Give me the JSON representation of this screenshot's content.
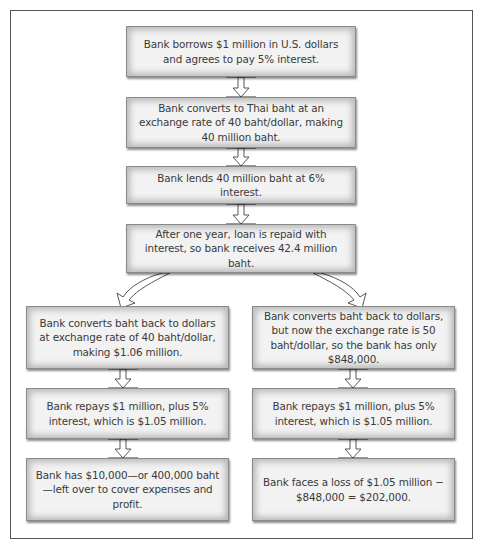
{
  "diagram": {
    "type": "flowchart",
    "center_steps": [
      {
        "id": "borrow",
        "text": "Bank borrows $1 million in U.S. dollars and agrees to pay 5% interest."
      },
      {
        "id": "convert",
        "text": "Bank converts to Thai baht at an exchange rate of 40 baht/dollar, making 40 million baht."
      },
      {
        "id": "lend",
        "text": "Bank lends 40 million baht at 6% interest."
      },
      {
        "id": "repaid",
        "text": "After one year, loan is repaid with interest, so bank receives 42.4 million baht."
      }
    ],
    "left_branch": [
      {
        "id": "left-convert-back",
        "text": "Bank converts baht back to dollars at exchange rate of 40 baht/dollar, making $1.06 million."
      },
      {
        "id": "left-repay",
        "text": "Bank repays $1 million, plus 5% interest, which is $1.05 million."
      },
      {
        "id": "left-result",
        "text": "Bank has $10,000—or 400,000 baht—left over to cover expenses and profit."
      }
    ],
    "right_branch": [
      {
        "id": "right-convert-back",
        "text": "Bank converts baht back to dollars, but now the exchange rate is 50 baht/dollar, so the bank has only $848,000."
      },
      {
        "id": "right-repay",
        "text": "Bank repays $1 million, plus 5% interest, which is $1.05 million."
      },
      {
        "id": "right-result",
        "text": "Bank faces a loss of $1.05 million − $848,000 = $202,000."
      }
    ],
    "colors": {
      "text": "#3a3a3a",
      "box_fill": "#f2f2f2",
      "box_edge": "#8a8a8a",
      "frame": "#555555",
      "arrow_fill": "#ffffff",
      "arrow_stroke": "#444444"
    }
  }
}
